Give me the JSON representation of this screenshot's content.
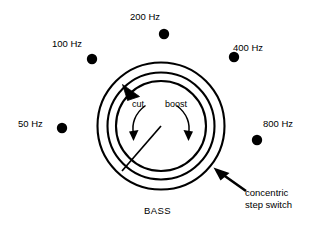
{
  "diagram": {
    "title_label": "BASS",
    "knob": {
      "name": "BASS",
      "pointer_angle_deg": 227,
      "direction_labels": {
        "cut": "cut",
        "boost": "boost"
      }
    },
    "step_switch": {
      "label_line1": "concentric",
      "label_line2": "step switch",
      "positions": [
        {
          "label": "50 Hz",
          "label_x": 18,
          "label_y": 127,
          "dot_x": 62,
          "dot_y": 128
        },
        {
          "label": "100 Hz",
          "label_x": 52,
          "label_y": 47,
          "dot_x": 92,
          "dot_y": 59
        },
        {
          "label": "200 Hz",
          "label_x": 130,
          "label_y": 20,
          "dot_x": 164,
          "dot_y": 34
        },
        {
          "label": "400 Hz",
          "label_x": 233,
          "label_y": 51,
          "dot_x": 234,
          "dot_y": 57
        },
        {
          "label": "800 Hz",
          "label_x": 263,
          "label_y": 127,
          "dot_x": 257,
          "dot_y": 140
        }
      ]
    },
    "colors": {
      "stroke": "#000000",
      "background": "#ffffff",
      "dot": "#000000"
    },
    "geometry": {
      "center_x": 161,
      "center_y": 126,
      "outer_ring_r": 64,
      "mid_ring_r": 56,
      "inner_ring_r": 46,
      "dot_radius": 5.2
    }
  }
}
